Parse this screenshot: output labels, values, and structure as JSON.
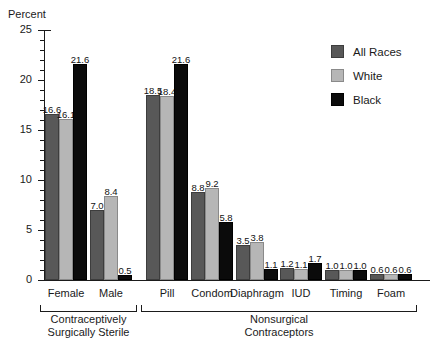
{
  "axis_title": "Percent",
  "title_sliver": "",
  "legend": {
    "position": "top-right",
    "entries": [
      {
        "label": "All Races",
        "color": "#585858"
      },
      {
        "label": "White",
        "color": "#b6b6b6"
      },
      {
        "label": "Black",
        "color": "#0b0b0b"
      }
    ]
  },
  "y_ticks": [
    "0",
    "5",
    "10",
    "15",
    "20",
    "25"
  ],
  "brackets": [
    {
      "label": "Contraceptively\nSurgically Sterile",
      "line1": "Contraceptively",
      "line2": "Surgically Sterile"
    },
    {
      "label": "Nonsurgical\nContraceptors",
      "line1": "Nonsurgical",
      "line2": "Contraceptors"
    }
  ],
  "chart_data": {
    "type": "bar",
    "title": "Percent",
    "xlabel": "",
    "ylabel": "Percent",
    "ylim": [
      0,
      25
    ],
    "ytick_step": 5,
    "yminor_step": 1,
    "grid": false,
    "legend_position": "top-right",
    "categories": [
      "Female",
      "Male",
      "Pill",
      "Condom",
      "Diaphragm",
      "IUD",
      "Timing",
      "Foam"
    ],
    "category_groups": [
      {
        "name": "Contraceptively Surgically Sterile",
        "categories": [
          "Female",
          "Male"
        ]
      },
      {
        "name": "Nonsurgical Contraceptors",
        "categories": [
          "Pill",
          "Condom",
          "Diaphragm",
          "IUD",
          "Timing",
          "Foam"
        ]
      }
    ],
    "series": [
      {
        "name": "All Races",
        "color": "#585858",
        "values": [
          16.6,
          7.0,
          18.5,
          8.8,
          3.5,
          1.2,
          1.0,
          0.6
        ]
      },
      {
        "name": "White",
        "color": "#b6b6b6",
        "values": [
          16.1,
          8.4,
          18.4,
          9.2,
          3.8,
          1.1,
          1.0,
          0.6
        ]
      },
      {
        "name": "Black",
        "color": "#0b0b0b",
        "values": [
          21.6,
          0.5,
          21.6,
          5.8,
          1.1,
          1.7,
          1.0,
          0.6
        ]
      }
    ],
    "data_labels": [
      [
        "16.6",
        "7.0",
        "18.5",
        "8.8",
        "3.5",
        "1.2",
        "1.0",
        "0.6"
      ],
      [
        "16.1",
        "8.4",
        "18.4",
        "9.2",
        "3.8",
        "1.1",
        "1.0",
        "0.6"
      ],
      [
        "21.6",
        "0.5",
        "21.6",
        "5.8",
        "1.1",
        "1.7",
        "1.0",
        "0.6"
      ]
    ]
  }
}
